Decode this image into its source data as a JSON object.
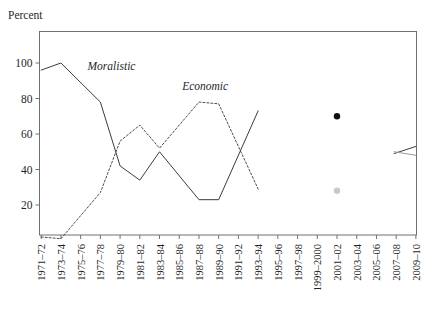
{
  "chart_data": {
    "type": "line",
    "title": "",
    "ylabel": "Percent",
    "xlabel": "",
    "ylim": [
      0,
      116
    ],
    "xlim": [
      0,
      19
    ],
    "grid": false,
    "legend": "inline-annotations",
    "yticks": [
      20,
      40,
      60,
      80,
      100
    ],
    "categories": [
      "1971–72",
      "1973–74",
      "1975–76",
      "1977–78",
      "1979–80",
      "1981–82",
      "1983–84",
      "1985–86",
      "1987–88",
      "1989–90",
      "1991–92",
      "1993–94",
      "1995–96",
      "1997–98",
      "1999–2000",
      "2001–02",
      "2003–04",
      "2005–06",
      "2007–08",
      "2009–10"
    ],
    "series": [
      {
        "name": "Moralistic",
        "style": "solid",
        "color": "#3c3c3c",
        "label_x_index": 2.35,
        "label_y": 96,
        "points": [
          {
            "x": 0,
            "y": 96
          },
          {
            "x": 1,
            "y": 100
          },
          {
            "x": 3,
            "y": 78
          },
          {
            "x": 4,
            "y": 42
          },
          {
            "x": 5,
            "y": 34
          },
          {
            "x": 6,
            "y": 50
          },
          {
            "x": 8,
            "y": 23
          },
          {
            "x": 9,
            "y": 23
          },
          {
            "x": 11,
            "y": 73
          }
        ]
      },
      {
        "name": "Economic",
        "style": "dotted",
        "color": "#4a4a4a",
        "label_x_index": 7.15,
        "label_y": 85,
        "points": [
          {
            "x": 0,
            "y": 2
          },
          {
            "x": 1,
            "y": 1
          },
          {
            "x": 3,
            "y": 27
          },
          {
            "x": 4,
            "y": 56
          },
          {
            "x": 5,
            "y": 65
          },
          {
            "x": 6,
            "y": 52
          },
          {
            "x": 8,
            "y": 78
          },
          {
            "x": 9,
            "y": 77
          },
          {
            "x": 11,
            "y": 29
          }
        ]
      }
    ],
    "markers": [
      {
        "name": "moralistic-2001-02-point",
        "x": 15,
        "y": 70,
        "color": "#101010",
        "radius": 3.2
      },
      {
        "name": "economic-2001-02-point",
        "x": 15,
        "y": 28,
        "color": "#c9c9c9",
        "radius": 3.2
      }
    ],
    "segments": [
      {
        "name": "moralistic-2007-10-segment",
        "style": "solid",
        "color": "#3c3c3c",
        "points": [
          {
            "x": 17.9,
            "y": 49
          },
          {
            "x": 19,
            "y": 53
          }
        ]
      },
      {
        "name": "economic-2007-10-segment",
        "style": "solid",
        "color": "#9a9a9a",
        "points": [
          {
            "x": 17.9,
            "y": 50
          },
          {
            "x": 19,
            "y": 48
          }
        ]
      }
    ]
  }
}
